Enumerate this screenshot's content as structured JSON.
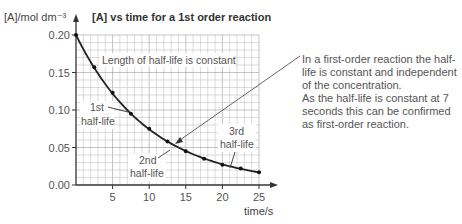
{
  "chart_data": {
    "type": "line",
    "title": "[A] vs time for a 1st order reaction",
    "xlabel": "time/s",
    "ylabel": "[A]/mol dm⁻³",
    "xlim": [
      0,
      25
    ],
    "ylim": [
      0,
      0.2
    ],
    "x_ticks": [
      5,
      10,
      15,
      20,
      25
    ],
    "y_ticks": [
      "0.00",
      "0.05",
      "0.10",
      "0.15",
      "0.20"
    ],
    "grid": true,
    "half_life_s": 7,
    "series": [
      {
        "name": "[A]",
        "x": [
          0,
          2.5,
          5,
          7.5,
          10,
          12.5,
          15,
          17.5,
          20,
          22.5,
          25
        ],
        "values": [
          0.2,
          0.157,
          0.123,
          0.095,
          0.075,
          0.058,
          0.045,
          0.035,
          0.027,
          0.022,
          0.017
        ]
      }
    ],
    "annotations": [
      {
        "text": "Length of half-life is constant"
      },
      {
        "text": "1st half-life",
        "lines": [
          "1st",
          "half-life"
        ]
      },
      {
        "text": "2nd half-life",
        "lines": [
          "2nd",
          "half-life"
        ]
      },
      {
        "text": "3rd half-life",
        "lines": [
          "3rd",
          "half-life"
        ]
      }
    ]
  },
  "side_note": {
    "paragraph1": "In a first-order reaction the half-life is constant and independent of the concentration.",
    "paragraph2": "As the half-life is constant at 7 seconds this can be confirmed as first-order reaction."
  }
}
